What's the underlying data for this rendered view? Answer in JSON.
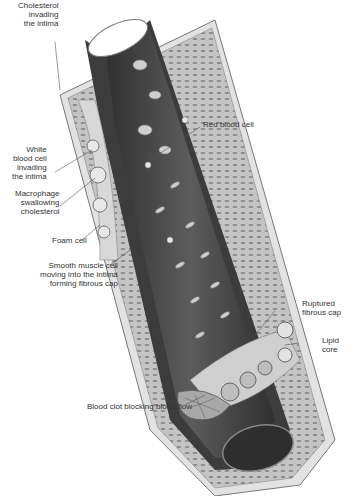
{
  "diagram": {
    "labels": {
      "cholesterol": "Cholesterol\ninvading\nthe intima",
      "red_blood_cell": "Red blood cell",
      "white_blood_cell": "White\nblood cell\ninvading\nthe intima",
      "macrophage": "Macrophage\nswallowing\ncholesterol",
      "foam_cell": "Foam cell",
      "smooth_muscle": "Smooth muscle cell\nmoving into the intima\nforming fibrous cap",
      "ruptured_cap": "Ruptured\nfibrous cap",
      "lipid_core": "Lipid\ncore",
      "blood_clot": "Blood clot blocking blood flow"
    },
    "colors": {
      "lumen": "#3a3a3a",
      "wall": "#b8b8b8",
      "outer_wall": "#dcdcdc",
      "label_text": "#333333",
      "leader_line": "#555555"
    }
  }
}
